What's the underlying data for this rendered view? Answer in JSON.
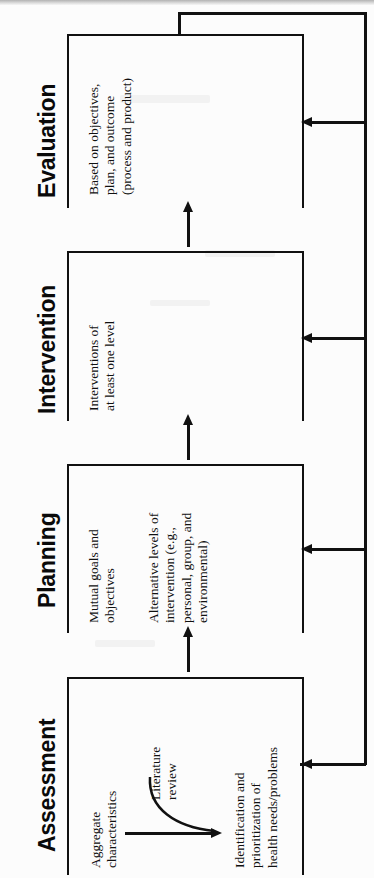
{
  "diagram": {
    "orientation": "rotated-90-ccw",
    "flow_direction": "Assessment to Planning to Intervention to Evaluation with feedback loop",
    "line_color": "#111111",
    "background_color": "#ffffff",
    "stages": [
      {
        "id": "evaluation",
        "heading": "Evaluation",
        "items": [
          "Based on objectives,\nplan, and outcome\n(process and product)"
        ]
      },
      {
        "id": "intervention",
        "heading": "Intervention",
        "items": [
          "Interventions of\nat least one level"
        ]
      },
      {
        "id": "planning",
        "heading": "Planning",
        "items": [
          "Mutual goals and\nobjectives",
          "Alternative levels of\nintervention (e.g.,\npersonal, group, and\nenvironmental)"
        ]
      },
      {
        "id": "assessment",
        "heading": "Assessment",
        "items": [
          "Aggregate\ncharacteristics",
          "Literature\nreview",
          "Identification and\nprioritization of\nhealth needs/problems"
        ]
      }
    ],
    "connectors": [
      {
        "id": "assessment-to-planning",
        "label": ""
      },
      {
        "id": "planning-to-intervention",
        "label": ""
      },
      {
        "id": "intervention-to-evaluation",
        "label": ""
      }
    ],
    "feedback": {
      "id": "evaluation-feedback-loop",
      "label": "",
      "targets": [
        "evaluation",
        "intervention",
        "planning",
        "assessment"
      ]
    }
  }
}
